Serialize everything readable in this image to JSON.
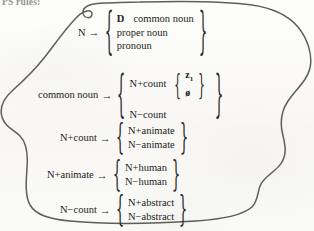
{
  "document": {
    "header_text": "PS rules:",
    "background_color": "#fbfbf9",
    "ink_color": "#2a2a2a",
    "annotation_shape": "hand-drawn-enclosing-loop"
  },
  "symbols": {
    "arrow": "→",
    "brace_left": "{",
    "brace_right": "}",
    "null_symbol": "ø"
  },
  "rules": [
    {
      "id": "rule-n",
      "lhs": "N",
      "arrow": "→",
      "rhs_lines": [
        {
          "cap": "D",
          "text": "common noun"
        },
        {
          "cap": "",
          "text": "proper noun"
        },
        {
          "cap": "",
          "text": "pronoun"
        }
      ]
    },
    {
      "id": "rule-common-noun",
      "lhs": "common noun",
      "arrow": "→",
      "rhs_lines": [
        {
          "cap": "",
          "text": "N+count"
        },
        {
          "cap": "",
          "text": "N−count"
        }
      ],
      "inner_group": {
        "lines": [
          "z",
          "ø"
        ],
        "subscript": "1"
      }
    },
    {
      "id": "rule-n-plus-count",
      "lhs": "N+count",
      "arrow": "→",
      "rhs_lines": [
        {
          "cap": "",
          "text": "N+animate"
        },
        {
          "cap": "",
          "text": "N−animate"
        }
      ]
    },
    {
      "id": "rule-n-plus-animate",
      "lhs": "N+animate",
      "arrow": "→",
      "rhs_lines": [
        {
          "cap": "",
          "text": "N+human"
        },
        {
          "cap": "",
          "text": "N−human"
        }
      ]
    },
    {
      "id": "rule-n-minus-count",
      "lhs": "N−count",
      "arrow": "→",
      "rhs_lines": [
        {
          "cap": "",
          "text": "N+abstract"
        },
        {
          "cap": "",
          "text": "N−abstract"
        }
      ]
    }
  ]
}
